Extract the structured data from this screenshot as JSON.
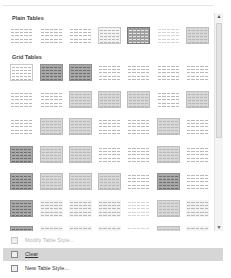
{
  "gallery": {
    "sections": [
      {
        "title": "Plain Tables",
        "rows": [
          [
            "plain",
            "plain",
            "plain",
            "boxed light",
            "darkgrid",
            "plain faint",
            "boxed mid"
          ]
        ]
      },
      {
        "title": "Grid Tables",
        "rows": [
          [
            "boxed",
            "dark",
            "dark",
            "plain",
            "plain",
            "plain",
            "plain"
          ],
          [
            "plain",
            "plain",
            "mid",
            "mid",
            "mid",
            "plain",
            "mid"
          ],
          [
            "plain",
            "mid",
            "mid",
            "plain",
            "plain",
            "mid",
            "plain"
          ],
          [
            "dark",
            "mid",
            "mid",
            "plain",
            "plain",
            "mid",
            "plain"
          ],
          [
            "dark",
            "mid",
            "mid",
            "mid",
            "plain",
            "dark",
            "plain"
          ],
          [
            "dark",
            "light",
            "light",
            "light",
            "faint",
            "mid",
            "light"
          ],
          [
            "dark",
            "light",
            "light",
            "light",
            "faint",
            "mid",
            "light"
          ]
        ]
      }
    ]
  },
  "scrollbar": {
    "up_icon": "▲",
    "down_icon": "▼"
  },
  "menu": {
    "items": [
      {
        "label": "Modify Table Style...",
        "state": "disabled",
        "icon": "modify-table-style-icon"
      },
      {
        "label": "Clear",
        "state": "highlighted",
        "icon": "clear-table-icon"
      },
      {
        "label": "New Table Style...",
        "state": "normal",
        "icon": "new-table-style-icon"
      }
    ]
  }
}
